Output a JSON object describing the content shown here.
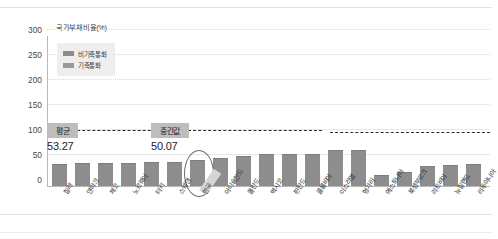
{
  "chart_data": {
    "type": "bar",
    "title": "국가부채비율(%)",
    "xlabel": "",
    "ylabel": "국가부채비율(%)",
    "ylim": [
      0,
      300
    ],
    "yticks": [
      0,
      50,
      100,
      150,
      200,
      250,
      300
    ],
    "grid": true,
    "legend_position": "top-left",
    "categories": [
      "칠레",
      "덴마크",
      "체코",
      "노르웨이",
      "터키",
      "스웨덴",
      "한국",
      "아이슬란드",
      "폴란드",
      "멕시코",
      "핀란드",
      "콜롬비아",
      "이스라엘",
      "헝가리",
      "에스토니아",
      "룩셈부르크",
      "라트비아",
      "뉴질랜드",
      "리투아니아"
    ],
    "values": [
      42.0,
      44.0,
      45.0,
      45.0,
      47.0,
      47.0,
      50.07,
      54.0,
      58.0,
      62.0,
      63.0,
      62.0,
      70.0,
      70.0,
      20.0,
      26.0,
      38.0,
      40.0,
      42.0
    ],
    "series": [
      {
        "name": "비기축통화",
        "values": [
          42.0,
          44.0,
          45.0,
          45.0,
          47.0,
          47.0,
          50.07,
          54.0,
          58.0,
          62.0,
          63.0,
          62.0,
          70.0,
          70.0,
          20.0,
          26.0,
          38.0,
          40.0,
          42.0
        ]
      }
    ],
    "legend": [
      {
        "label": "비기축통화",
        "color": "#8d8d8d"
      },
      {
        "label": "기축통화",
        "color": "#9a9a9a"
      }
    ],
    "annotations": [
      {
        "name": "평균",
        "value": "53.27",
        "line": 53.27
      },
      {
        "name": "중간값",
        "value": "50.07",
        "line": 50.07
      }
    ],
    "highlight_category": "한국"
  },
  "colors": {
    "bar": "#8d8d8d",
    "bar_key": "#9a9a9a",
    "refline": "#2b2b2b",
    "annot_bg": "#bdbdbd",
    "grid": "#d7d7d7",
    "axis": "#b9b9b9"
  },
  "ytick_labels": [
    "300",
    "250",
    "200",
    "150",
    "100",
    "50",
    "0"
  ]
}
